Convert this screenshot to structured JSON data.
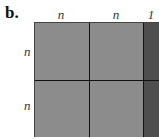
{
  "panel": {
    "label": "b.",
    "column_labels": [
      "n",
      "n",
      "1"
    ],
    "row_labels": [
      "n",
      "n"
    ],
    "colors": {
      "block": "#8c8c8c",
      "extra_column": "#4e4e4e",
      "lines": "#111111"
    }
  }
}
